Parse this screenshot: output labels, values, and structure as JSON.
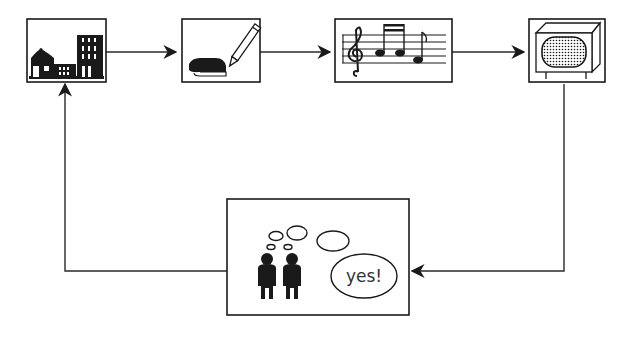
{
  "diagram": {
    "type": "cycle",
    "nodes": [
      {
        "id": "city",
        "icon": "city-buildings-icon",
        "position": "top-1"
      },
      {
        "id": "writing",
        "icon": "book-and-pencil-icon",
        "position": "top-2"
      },
      {
        "id": "music",
        "icon": "sheet-music-icon",
        "position": "top-3"
      },
      {
        "id": "tv",
        "icon": "television-icon",
        "position": "top-4"
      },
      {
        "id": "audience",
        "icon": "people-thinking-icon",
        "position": "bottom",
        "speech_bubble": "yes!"
      }
    ],
    "edges": [
      {
        "from": "city",
        "to": "writing"
      },
      {
        "from": "writing",
        "to": "music"
      },
      {
        "from": "music",
        "to": "tv"
      },
      {
        "from": "tv",
        "to": "audience"
      },
      {
        "from": "audience",
        "to": "city"
      }
    ],
    "colors": {
      "ink": "#1a1a1a",
      "background": "#ffffff"
    }
  }
}
